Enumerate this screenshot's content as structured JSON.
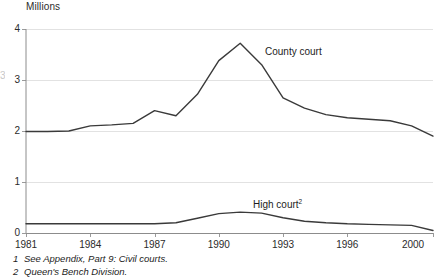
{
  "chart_data": {
    "type": "line",
    "title": "",
    "subtitle": "",
    "unit_label": "Millions",
    "xlabel": "",
    "ylabel": "Millions",
    "xlim": [
      1981,
      2000
    ],
    "ylim": [
      0,
      4
    ],
    "y_ticks": [
      "0",
      "1",
      "2",
      "3",
      "4"
    ],
    "y_tick_values": [
      0,
      1,
      2,
      3,
      4
    ],
    "x_ticks": [
      "1981",
      "1984",
      "1987",
      "1990",
      "1993",
      "1996",
      "2000"
    ],
    "x_tick_values": [
      1981,
      1984,
      1987,
      1990,
      1993,
      1996,
      2000
    ],
    "grid": "horizontal",
    "legend_position": "inline-annotations",
    "line_color": "#3a3a3a",
    "grid_color": "#e2e2e2",
    "axis_color": "#9a9a9a",
    "x": [
      1981,
      1982,
      1983,
      1984,
      1985,
      1986,
      1987,
      1988,
      1989,
      1990,
      1991,
      1992,
      1993,
      1994,
      1995,
      1996,
      1997,
      1998,
      1999,
      2000
    ],
    "series": [
      {
        "name": "County court",
        "label": "County court",
        "values": [
          1.99,
          1.99,
          2.0,
          2.1,
          2.12,
          2.15,
          2.4,
          2.3,
          2.72,
          3.38,
          3.72,
          3.3,
          2.65,
          2.45,
          2.32,
          2.26,
          2.23,
          2.2,
          2.1,
          1.9
        ]
      },
      {
        "name": "High court",
        "label": "High court",
        "footnote_ref": "2",
        "values": [
          0.18,
          0.18,
          0.18,
          0.18,
          0.18,
          0.18,
          0.18,
          0.2,
          0.29,
          0.38,
          0.41,
          0.39,
          0.3,
          0.23,
          0.2,
          0.18,
          0.17,
          0.16,
          0.15,
          0.05
        ]
      }
    ],
    "annotations": [
      {
        "text": "County court",
        "x": 1993.0,
        "y": 3.05
      },
      {
        "text": "High court",
        "x": 1991.5,
        "y": 0.55
      }
    ]
  },
  "footnotes": [
    {
      "number": "1",
      "text": "See Appendix, Part 9: Civil courts."
    },
    {
      "number": "2",
      "text": "Queen's Bench Division."
    }
  ],
  "series_labels": {
    "county_court": "County court",
    "high_court": "High court",
    "high_court_ref": "2"
  }
}
